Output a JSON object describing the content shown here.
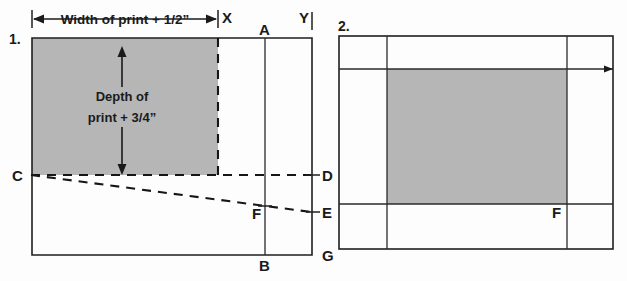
{
  "figure": {
    "title_hidden": "",
    "background_color": "#fdfdfd",
    "line_color": "#1f1f1f",
    "fill_gray": "#b6b6b6"
  },
  "diagram1": {
    "number_label": "1.",
    "width_dimension_text": "Width of print + 1/2”",
    "depth_note_line1": "Depth of",
    "depth_note_line2": "print + 3/4”",
    "points": {
      "x": "X",
      "y": "Y",
      "a": "A",
      "b": "B",
      "c": "C",
      "d": "D",
      "e": "E",
      "f": "F",
      "g": "G"
    }
  },
  "diagram2": {
    "number_label": "2.",
    "points": {
      "f": "F"
    }
  }
}
